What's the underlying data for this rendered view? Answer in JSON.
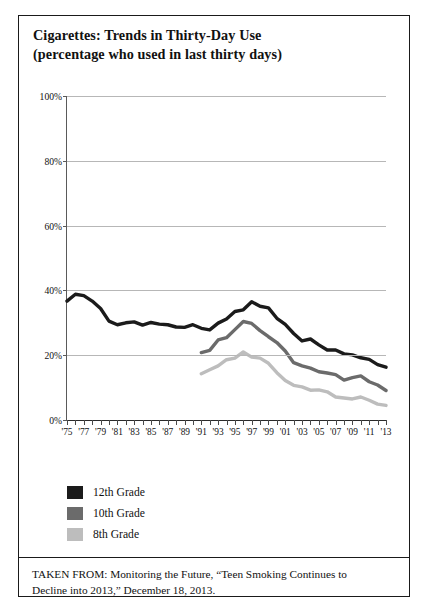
{
  "figure": {
    "title_line1": "Cigarettes: Trends in Thirty-Day Use",
    "title_line2": "(percentage who used in last thirty days)",
    "source_line1": "TAKEN FROM: Monitoring the Future, “Teen Smoking Continues to",
    "source_line2": "Decline into 2013,” December 18, 2013."
  },
  "legend": {
    "items": [
      {
        "label": "12th Grade",
        "color": "#1b1b1b"
      },
      {
        "label": "10th Grade",
        "color": "#6b6b6b"
      },
      {
        "label": "8th Grade",
        "color": "#bdbdbd"
      }
    ]
  },
  "chart_data": {
    "type": "line",
    "title": "Cigarettes: Trends in Thirty-Day Use (percentage who used in last thirty days)",
    "xlabel": "",
    "ylabel": "",
    "ylim": [
      0,
      100
    ],
    "xlim": [
      1975,
      2013
    ],
    "grid": true,
    "legend_position": "below-left",
    "ytick_labels": [
      "0%",
      "20%",
      "40%",
      "60%",
      "80%",
      "100%"
    ],
    "ytick_values": [
      0,
      20,
      40,
      60,
      80,
      100
    ],
    "xtick_labels": [
      "'75",
      "'77",
      "'79",
      "'81",
      "'83",
      "'85",
      "'87",
      "'89",
      "'91",
      "'93",
      "'95",
      "'97",
      "'99",
      "'01",
      "'03",
      "'05",
      "'07",
      "'09",
      "'11",
      "'13"
    ],
    "xtick_values": [
      1975,
      1977,
      1979,
      1981,
      1983,
      1985,
      1987,
      1989,
      1991,
      1993,
      1995,
      1997,
      1999,
      2001,
      2003,
      2005,
      2007,
      2009,
      2011,
      2013
    ],
    "series": [
      {
        "name": "12th Grade",
        "color": "#1b1b1b",
        "x": [
          1975,
          1976,
          1977,
          1978,
          1979,
          1980,
          1981,
          1982,
          1983,
          1984,
          1985,
          1986,
          1987,
          1988,
          1989,
          1990,
          1991,
          1992,
          1993,
          1994,
          1995,
          1996,
          1997,
          1998,
          1999,
          2000,
          2001,
          2002,
          2003,
          2004,
          2005,
          2006,
          2007,
          2008,
          2009,
          2010,
          2011,
          2012,
          2013
        ],
        "values": [
          36.7,
          38.8,
          38.4,
          36.7,
          34.4,
          30.5,
          29.4,
          30.0,
          30.3,
          29.3,
          30.1,
          29.6,
          29.4,
          28.7,
          28.6,
          29.4,
          28.3,
          27.8,
          29.9,
          31.2,
          33.5,
          34.0,
          36.5,
          35.1,
          34.6,
          31.4,
          29.5,
          26.7,
          24.4,
          25.0,
          23.2,
          21.6,
          21.6,
          20.4,
          20.1,
          19.2,
          18.7,
          17.1,
          16.3
        ]
      },
      {
        "name": "10th Grade",
        "color": "#6b6b6b",
        "x": [
          1991,
          1992,
          1993,
          1994,
          1995,
          1996,
          1997,
          1998,
          1999,
          2000,
          2001,
          2002,
          2003,
          2004,
          2005,
          2006,
          2007,
          2008,
          2009,
          2010,
          2011,
          2012,
          2013
        ],
        "values": [
          20.8,
          21.5,
          24.7,
          25.4,
          27.9,
          30.4,
          29.8,
          27.6,
          25.7,
          23.9,
          21.3,
          17.7,
          16.7,
          16.0,
          14.9,
          14.5,
          14.0,
          12.3,
          13.1,
          13.6,
          11.8,
          10.8,
          9.1
        ]
      },
      {
        "name": "8th Grade",
        "color": "#bdbdbd",
        "x": [
          1991,
          1992,
          1993,
          1994,
          1995,
          1996,
          1997,
          1998,
          1999,
          2000,
          2001,
          2002,
          2003,
          2004,
          2005,
          2006,
          2007,
          2008,
          2009,
          2010,
          2011,
          2012,
          2013
        ],
        "values": [
          14.3,
          15.5,
          16.7,
          18.6,
          19.1,
          21.0,
          19.4,
          19.1,
          17.5,
          14.6,
          12.2,
          10.7,
          10.2,
          9.2,
          9.3,
          8.7,
          7.1,
          6.8,
          6.5,
          7.1,
          6.1,
          4.9,
          4.5
        ]
      }
    ]
  }
}
